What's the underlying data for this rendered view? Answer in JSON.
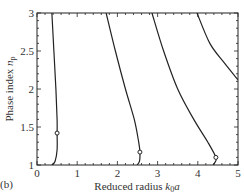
{
  "panel_label": "(b)",
  "chart_data": {
    "type": "line",
    "title": "",
    "xlabel": "Reduced radius k0a",
    "xlabel_parts": {
      "main": "Reduced radius ",
      "k": "k",
      "sub": "0",
      "tail": "a"
    },
    "ylabel": "Phase index np",
    "ylabel_parts": {
      "main": "Phase index ",
      "n": "n",
      "sub": "p"
    },
    "xlim": [
      0,
      5
    ],
    "ylim": [
      1,
      3
    ],
    "xticks": [
      "0",
      "1",
      "2",
      "3",
      "4",
      "5"
    ],
    "yticks": [
      "1",
      "1.5",
      "2",
      "2.5",
      "3"
    ],
    "grid": false,
    "legend": null,
    "series": [
      {
        "name": "mode-1",
        "points": [
          [
            0.37,
            3.0
          ],
          [
            0.42,
            2.5
          ],
          [
            0.47,
            2.0
          ],
          [
            0.5,
            1.6
          ],
          [
            0.5,
            1.42
          ],
          [
            0.5,
            1.2
          ],
          [
            0.45,
            1.05
          ],
          [
            0.37,
            1.0
          ]
        ],
        "marker": [
          0.5,
          1.42
        ]
      },
      {
        "name": "mode-2",
        "points": [
          [
            1.72,
            3.0
          ],
          [
            1.95,
            2.5
          ],
          [
            2.2,
            2.0
          ],
          [
            2.42,
            1.6
          ],
          [
            2.53,
            1.3
          ],
          [
            2.56,
            1.17
          ],
          [
            2.55,
            1.05
          ],
          [
            2.49,
            1.0
          ]
        ],
        "marker": [
          2.56,
          1.17
        ]
      },
      {
        "name": "mode-3",
        "points": [
          [
            2.86,
            3.0
          ],
          [
            3.15,
            2.5
          ],
          [
            3.5,
            2.0
          ],
          [
            3.9,
            1.6
          ],
          [
            4.25,
            1.3
          ],
          [
            4.45,
            1.1
          ],
          [
            4.42,
            1.03
          ],
          [
            4.38,
            1.0
          ]
        ],
        "marker": [
          4.45,
          1.1
        ]
      },
      {
        "name": "mode-4",
        "points": [
          [
            3.98,
            3.0
          ],
          [
            4.3,
            2.6
          ],
          [
            4.65,
            2.35
          ],
          [
            5.0,
            2.12
          ]
        ],
        "marker": null
      }
    ],
    "markers": [
      [
        0.5,
        1.42
      ],
      [
        2.56,
        1.17
      ],
      [
        4.45,
        1.1
      ]
    ]
  }
}
